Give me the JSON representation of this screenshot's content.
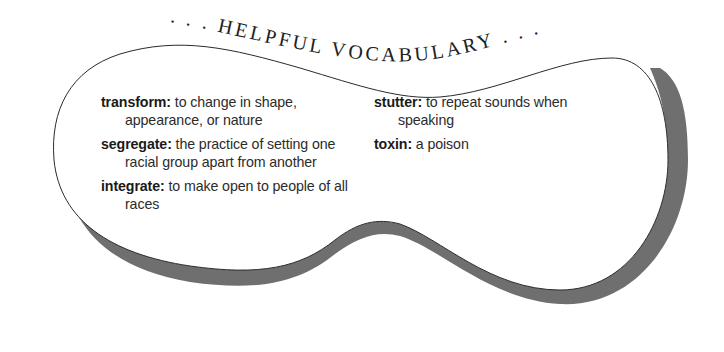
{
  "title": {
    "text": ". . . HELPFUL VOCABULARY . . ."
  },
  "colors": {
    "outline": "#2a2a2a",
    "shadow_band": "#6f6f6f",
    "fill": "#ffffff",
    "text": "#2b2b2b"
  },
  "vocabulary": {
    "left": [
      {
        "term": "transform:",
        "definition": " to change in shape, appearance, or nature"
      },
      {
        "term": "segregate:",
        "definition": " the practice of setting one racial group apart from another"
      },
      {
        "term": "integrate:",
        "definition": " to make open to people of all races"
      }
    ],
    "right": [
      {
        "term": "stutter:",
        "definition": " to repeat sounds when speaking"
      },
      {
        "term": "toxin:",
        "definition": " a poison"
      }
    ]
  }
}
